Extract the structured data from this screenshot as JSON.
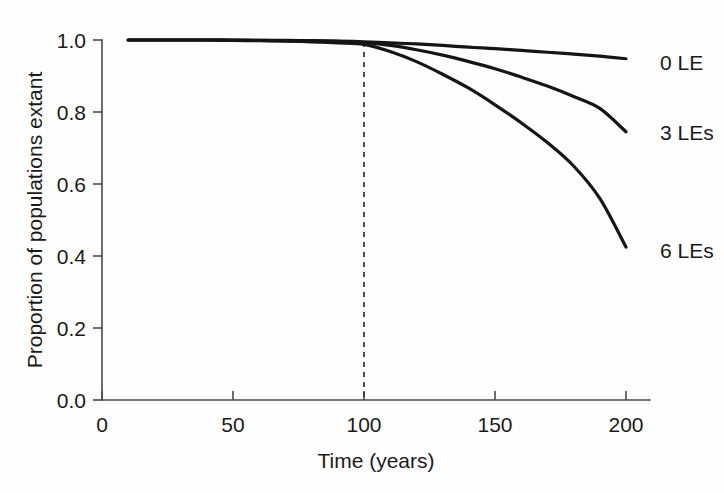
{
  "chart_data": {
    "type": "line",
    "title": "",
    "subtitle": "",
    "xlabel": "Time (years)",
    "ylabel": "Proportion of populations extant",
    "xlim": [
      0,
      215
    ],
    "ylim": [
      0.0,
      1.0
    ],
    "xticks": [
      0,
      50,
      100,
      150,
      200
    ],
    "xticklabels": [
      "0",
      "50",
      "100",
      "150",
      "200"
    ],
    "yticks": [
      0.0,
      0.2,
      0.4,
      0.6,
      0.8,
      1.0
    ],
    "yticklabels": [
      "0.0",
      "0.2",
      "0.4",
      "0.6",
      "0.8",
      "1.0"
    ],
    "grid": false,
    "legend_position": "right-inline-labels",
    "annotations": [
      {
        "name": "vertical-dashed-marker",
        "type": "vline",
        "x": 100,
        "y_from": 0.0,
        "y_to": 0.995,
        "style": "dashed"
      }
    ],
    "x": [
      10,
      20,
      30,
      40,
      50,
      60,
      70,
      80,
      90,
      100,
      110,
      120,
      130,
      140,
      150,
      160,
      170,
      180,
      190,
      200
    ],
    "series": [
      {
        "name": "0 LE",
        "label": "0 LE",
        "color": "#151515",
        "values": [
          1.0,
          1.0,
          1.0,
          1.0,
          1.0,
          0.999,
          0.999,
          0.998,
          0.997,
          0.995,
          0.992,
          0.989,
          0.985,
          0.98,
          0.976,
          0.971,
          0.966,
          0.961,
          0.955,
          0.948
        ]
      },
      {
        "name": "3 LEs",
        "label": "3 LEs",
        "color": "#151515",
        "values": [
          1.0,
          1.0,
          1.0,
          1.0,
          0.999,
          0.999,
          0.998,
          0.997,
          0.996,
          0.993,
          0.985,
          0.973,
          0.958,
          0.94,
          0.92,
          0.897,
          0.872,
          0.843,
          0.81,
          0.745
        ]
      },
      {
        "name": "6 LEs",
        "label": "6 LEs",
        "color": "#151515",
        "values": [
          1.0,
          1.0,
          1.0,
          1.0,
          0.999,
          0.998,
          0.997,
          0.995,
          0.992,
          0.988,
          0.968,
          0.94,
          0.905,
          0.866,
          0.82,
          0.77,
          0.715,
          0.65,
          0.56,
          0.425
        ]
      }
    ]
  },
  "labels": {
    "ylabel": "Proportion of populations extant",
    "xlabel": "Time (years)",
    "x_ticks": [
      "0",
      "50",
      "100",
      "150",
      "200"
    ],
    "y_ticks": [
      "1.0",
      "0.8",
      "0.6",
      "0.4",
      "0.2",
      "0.0"
    ],
    "series": [
      "0 LE",
      "3 LEs",
      "6 LEs"
    ]
  }
}
